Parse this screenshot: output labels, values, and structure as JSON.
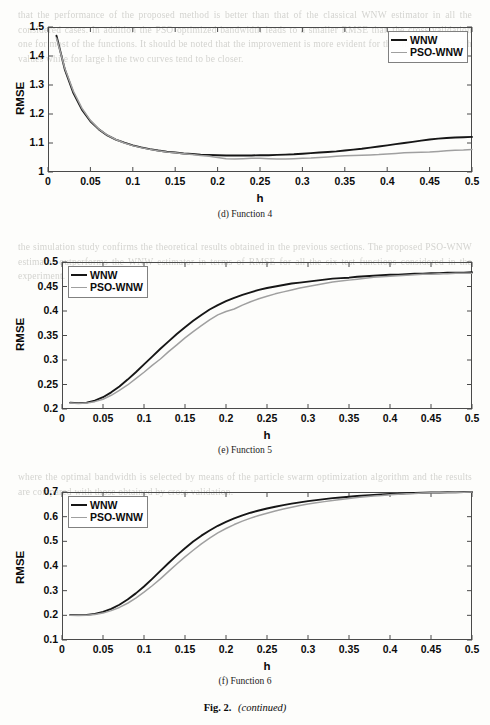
{
  "figure": {
    "caption_prefix": "Fig. 2.",
    "caption_suffix": "(continued)"
  },
  "background_text": {
    "block_top": "that the performance of the proposed method is better than that of the classical WNW estimator in all the considered cases. In addition the PSO optimized bandwidth leads to a smaller RMSE than the cross validation one for most of the functions. It should be noted that the improvement is more evident for the smaller bandwidth values while for large h the two curves tend to be closer.",
    "block_mid": "the simulation study confirms the theoretical results obtained in the previous sections. The proposed PSO-WNW estimator outperforms the WNW estimator in terms of RMSE for all the six test functions considered in the experiment.",
    "block_bot": "where the optimal bandwidth is selected by means of the particle swarm optimization algorithm and the results are compared with those obtained by cross validation."
  },
  "charts": [
    {
      "id": "function-4",
      "type": "line",
      "subcaption": "(d) Function 4",
      "title": "",
      "xlabel": "h",
      "ylabel": "RMSE",
      "xlim": [
        0,
        0.5
      ],
      "ylim": [
        1,
        1.5
      ],
      "xticks": [
        0,
        0.05,
        0.1,
        0.15,
        0.2,
        0.25,
        0.3,
        0.35,
        0.4,
        0.45,
        0.5
      ],
      "xticklabels": [
        "0",
        "0.05",
        "0.1",
        "0.15",
        "0.2",
        "0.25",
        "0.3",
        "0.35",
        "0.4",
        "0.45",
        "0.5"
      ],
      "yticks": [
        1,
        1.1,
        1.2,
        1.3,
        1.4,
        1.5
      ],
      "yticklabels": [
        "1",
        "1.1",
        "1.2",
        "1.3",
        "1.4",
        "1.5"
      ],
      "grid": false,
      "legend_position": "top-right",
      "series": [
        {
          "name": "WNW",
          "color": "#161616",
          "width": 1.9,
          "x": [
            0.01,
            0.02,
            0.03,
            0.04,
            0.05,
            0.06,
            0.07,
            0.08,
            0.09,
            0.1,
            0.11,
            0.12,
            0.13,
            0.14,
            0.15,
            0.16,
            0.17,
            0.18,
            0.19,
            0.2,
            0.21,
            0.22,
            0.23,
            0.24,
            0.25,
            0.26,
            0.27,
            0.28,
            0.29,
            0.3,
            0.31,
            0.32,
            0.33,
            0.34,
            0.35,
            0.36,
            0.37,
            0.38,
            0.39,
            0.4,
            0.41,
            0.42,
            0.43,
            0.44,
            0.45,
            0.46,
            0.47,
            0.48,
            0.49,
            0.5
          ],
          "y": [
            1.47,
            1.352,
            1.272,
            1.215,
            1.175,
            1.147,
            1.126,
            1.112,
            1.101,
            1.092,
            1.085,
            1.079,
            1.074,
            1.07,
            1.067,
            1.064,
            1.062,
            1.06,
            1.059,
            1.058,
            1.057,
            1.057,
            1.057,
            1.057,
            1.058,
            1.058,
            1.059,
            1.06,
            1.061,
            1.063,
            1.065,
            1.067,
            1.069,
            1.071,
            1.074,
            1.077,
            1.08,
            1.084,
            1.088,
            1.092,
            1.096,
            1.1,
            1.104,
            1.108,
            1.112,
            1.115,
            1.117,
            1.119,
            1.12,
            1.121
          ]
        },
        {
          "name": "PSO-WNW",
          "color": "#a0a0a0",
          "width": 1.5,
          "x": [
            0.01,
            0.02,
            0.03,
            0.04,
            0.05,
            0.06,
            0.07,
            0.08,
            0.09,
            0.1,
            0.11,
            0.12,
            0.13,
            0.14,
            0.15,
            0.16,
            0.17,
            0.18,
            0.19,
            0.2,
            0.21,
            0.22,
            0.23,
            0.24,
            0.25,
            0.26,
            0.27,
            0.28,
            0.29,
            0.3,
            0.31,
            0.32,
            0.33,
            0.34,
            0.35,
            0.36,
            0.37,
            0.38,
            0.39,
            0.4,
            0.41,
            0.42,
            0.43,
            0.44,
            0.45,
            0.46,
            0.47,
            0.48,
            0.49,
            0.5
          ],
          "y": [
            1.462,
            1.356,
            1.278,
            1.22,
            1.178,
            1.148,
            1.127,
            1.112,
            1.1,
            1.091,
            1.084,
            1.078,
            1.073,
            1.069,
            1.066,
            1.063,
            1.06,
            1.057,
            1.054,
            1.05,
            1.046,
            1.045,
            1.046,
            1.047,
            1.047,
            1.046,
            1.045,
            1.045,
            1.046,
            1.047,
            1.048,
            1.05,
            1.052,
            1.054,
            1.056,
            1.057,
            1.058,
            1.059,
            1.06,
            1.062,
            1.064,
            1.066,
            1.067,
            1.068,
            1.069,
            1.071,
            1.073,
            1.075,
            1.076,
            1.078
          ]
        }
      ]
    },
    {
      "id": "function-5",
      "type": "line",
      "subcaption": "(e) Function 5",
      "title": "",
      "xlabel": "h",
      "ylabel": "RMSE",
      "xlim": [
        0,
        0.5
      ],
      "ylim": [
        0.2,
        0.5
      ],
      "xticks": [
        0,
        0.05,
        0.1,
        0.15,
        0.2,
        0.25,
        0.3,
        0.35,
        0.4,
        0.45,
        0.5
      ],
      "xticklabels": [
        "0",
        "0.05",
        "0.1",
        "0.15",
        "0.2",
        "0.25",
        "0.3",
        "0.35",
        "0.4",
        "0.45",
        "0.5"
      ],
      "yticks": [
        0.2,
        0.25,
        0.3,
        0.35,
        0.4,
        0.45,
        0.5
      ],
      "yticklabels": [
        "0.2",
        "0.25",
        "0.3",
        "0.35",
        "0.4",
        "0.45",
        "0.5"
      ],
      "grid": false,
      "legend_position": "top-left",
      "series": [
        {
          "name": "WNW",
          "color": "#161616",
          "width": 1.9,
          "x": [
            0.01,
            0.02,
            0.03,
            0.04,
            0.05,
            0.06,
            0.07,
            0.08,
            0.09,
            0.1,
            0.11,
            0.12,
            0.13,
            0.14,
            0.15,
            0.16,
            0.17,
            0.18,
            0.19,
            0.2,
            0.21,
            0.22,
            0.23,
            0.24,
            0.25,
            0.26,
            0.27,
            0.28,
            0.29,
            0.3,
            0.31,
            0.32,
            0.33,
            0.34,
            0.35,
            0.36,
            0.37,
            0.38,
            0.39,
            0.4,
            0.41,
            0.42,
            0.43,
            0.44,
            0.45,
            0.46,
            0.47,
            0.48,
            0.49,
            0.5
          ],
          "y": [
            0.213,
            0.212,
            0.213,
            0.217,
            0.224,
            0.234,
            0.246,
            0.26,
            0.275,
            0.291,
            0.307,
            0.323,
            0.338,
            0.353,
            0.367,
            0.38,
            0.392,
            0.403,
            0.412,
            0.42,
            0.427,
            0.433,
            0.438,
            0.443,
            0.447,
            0.45,
            0.453,
            0.456,
            0.458,
            0.46,
            0.462,
            0.464,
            0.466,
            0.467,
            0.468,
            0.47,
            0.471,
            0.472,
            0.473,
            0.474,
            0.474,
            0.475,
            0.476,
            0.476,
            0.477,
            0.477,
            0.478,
            0.478,
            0.478,
            0.479
          ]
        },
        {
          "name": "PSO-WNW",
          "color": "#a0a0a0",
          "width": 1.5,
          "x": [
            0.01,
            0.02,
            0.03,
            0.04,
            0.05,
            0.06,
            0.07,
            0.08,
            0.09,
            0.1,
            0.11,
            0.12,
            0.13,
            0.14,
            0.15,
            0.16,
            0.17,
            0.18,
            0.19,
            0.2,
            0.21,
            0.22,
            0.23,
            0.24,
            0.25,
            0.26,
            0.27,
            0.28,
            0.29,
            0.3,
            0.31,
            0.32,
            0.33,
            0.34,
            0.35,
            0.36,
            0.37,
            0.38,
            0.39,
            0.4,
            0.41,
            0.42,
            0.43,
            0.44,
            0.45,
            0.46,
            0.47,
            0.48,
            0.49,
            0.5
          ],
          "y": [
            0.212,
            0.211,
            0.212,
            0.215,
            0.22,
            0.228,
            0.238,
            0.249,
            0.262,
            0.275,
            0.289,
            0.302,
            0.317,
            0.331,
            0.345,
            0.358,
            0.37,
            0.382,
            0.392,
            0.399,
            0.404,
            0.412,
            0.419,
            0.425,
            0.43,
            0.435,
            0.439,
            0.443,
            0.447,
            0.45,
            0.453,
            0.456,
            0.459,
            0.461,
            0.463,
            0.465,
            0.467,
            0.469,
            0.47,
            0.471,
            0.472,
            0.473,
            0.474,
            0.475,
            0.475,
            0.476,
            0.476,
            0.477,
            0.477,
            0.477
          ]
        }
      ]
    },
    {
      "id": "function-6",
      "type": "line",
      "subcaption": "(f) Function 6",
      "title": "",
      "xlabel": "h",
      "ylabel": "RMSE",
      "xlim": [
        0,
        0.5
      ],
      "ylim": [
        0.1,
        0.7
      ],
      "xticks": [
        0,
        0.05,
        0.1,
        0.15,
        0.2,
        0.25,
        0.3,
        0.35,
        0.4,
        0.45,
        0.5
      ],
      "xticklabels": [
        "0",
        "0.05",
        "0.1",
        "0.15",
        "0.2",
        "0.25",
        "0.3",
        "0.35",
        "0.4",
        "0.45",
        "0.5"
      ],
      "yticks": [
        0.1,
        0.2,
        0.3,
        0.4,
        0.5,
        0.6,
        0.7
      ],
      "yticklabels": [
        "0.1",
        "0.2",
        "0.3",
        "0.4",
        "0.5",
        "0.6",
        "0.7"
      ],
      "grid": false,
      "legend_position": "top-left",
      "series": [
        {
          "name": "WNW",
          "color": "#161616",
          "width": 1.9,
          "x": [
            0.01,
            0.02,
            0.03,
            0.04,
            0.05,
            0.06,
            0.07,
            0.08,
            0.09,
            0.1,
            0.11,
            0.12,
            0.13,
            0.14,
            0.15,
            0.16,
            0.17,
            0.18,
            0.19,
            0.2,
            0.21,
            0.22,
            0.23,
            0.24,
            0.25,
            0.26,
            0.27,
            0.28,
            0.29,
            0.3,
            0.31,
            0.32,
            0.33,
            0.34,
            0.35,
            0.36,
            0.37,
            0.38,
            0.39,
            0.4,
            0.41,
            0.42,
            0.43,
            0.44,
            0.45,
            0.46,
            0.47,
            0.48,
            0.49,
            0.5
          ],
          "y": [
            0.202,
            0.201,
            0.202,
            0.206,
            0.214,
            0.226,
            0.243,
            0.264,
            0.289,
            0.317,
            0.348,
            0.38,
            0.412,
            0.443,
            0.472,
            0.499,
            0.523,
            0.544,
            0.563,
            0.579,
            0.593,
            0.605,
            0.616,
            0.625,
            0.633,
            0.64,
            0.647,
            0.653,
            0.658,
            0.663,
            0.667,
            0.671,
            0.675,
            0.678,
            0.681,
            0.684,
            0.686,
            0.688,
            0.69,
            0.692,
            0.693,
            0.695,
            0.696,
            0.697,
            0.698,
            0.698,
            0.699,
            0.699,
            0.7,
            0.7
          ]
        },
        {
          "name": "PSO-WNW",
          "color": "#a0a0a0",
          "width": 1.5,
          "x": [
            0.01,
            0.02,
            0.03,
            0.04,
            0.05,
            0.06,
            0.07,
            0.08,
            0.09,
            0.1,
            0.11,
            0.12,
            0.13,
            0.14,
            0.15,
            0.16,
            0.17,
            0.18,
            0.19,
            0.2,
            0.21,
            0.22,
            0.23,
            0.24,
            0.25,
            0.26,
            0.27,
            0.28,
            0.29,
            0.3,
            0.31,
            0.32,
            0.33,
            0.34,
            0.35,
            0.36,
            0.37,
            0.38,
            0.39,
            0.4,
            0.41,
            0.42,
            0.43,
            0.44,
            0.45,
            0.46,
            0.47,
            0.48,
            0.49,
            0.5
          ],
          "y": [
            0.2,
            0.199,
            0.2,
            0.203,
            0.209,
            0.219,
            0.232,
            0.249,
            0.27,
            0.294,
            0.32,
            0.348,
            0.378,
            0.408,
            0.437,
            0.464,
            0.49,
            0.513,
            0.534,
            0.552,
            0.568,
            0.582,
            0.594,
            0.605,
            0.614,
            0.623,
            0.631,
            0.638,
            0.645,
            0.651,
            0.656,
            0.661,
            0.666,
            0.67,
            0.674,
            0.678,
            0.681,
            0.684,
            0.686,
            0.689,
            0.691,
            0.693,
            0.694,
            0.696,
            0.697,
            0.698,
            0.698,
            0.699,
            0.699,
            0.7
          ]
        }
      ]
    }
  ]
}
